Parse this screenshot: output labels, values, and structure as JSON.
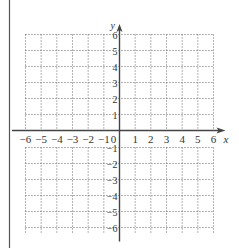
{
  "chart_data": {
    "type": "coordinate-grid",
    "title": "",
    "xlabel": "x",
    "ylabel": "y",
    "xlim": [
      -6,
      6
    ],
    "ylim": [
      -6,
      6
    ],
    "grid": true,
    "grid_style": "dotted",
    "x_ticks": [
      "-6",
      "-5",
      "-4",
      "-3",
      "-2",
      "-1",
      "0",
      "1",
      "2",
      "3",
      "4",
      "5",
      "6"
    ],
    "y_ticks": [
      "6",
      "5",
      "4",
      "3",
      "2",
      "1",
      "-1",
      "-2",
      "-3",
      "-4",
      "-5",
      "-6"
    ],
    "series": []
  },
  "labels": {
    "x_axis": "x",
    "y_axis": "y",
    "origin": "0"
  },
  "colors": {
    "axis": "#444444",
    "grid": "#666666",
    "text": "#333333",
    "border": "#555555"
  }
}
